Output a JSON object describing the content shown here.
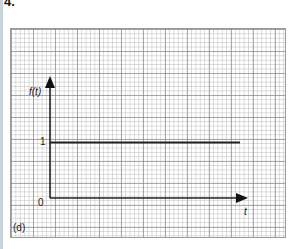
{
  "problem_number": "4.",
  "panel_label": "(d)",
  "axes": {
    "y_label": "f(t)",
    "x_label": "t",
    "origin_label": "0",
    "y_tick_label": "1"
  },
  "function": {
    "description": "constant function f(t) = 1 for t >= 0",
    "value": 1
  },
  "colors": {
    "grid_major": "#888888",
    "grid_minor": "#bbbbbb",
    "curve": "#222222"
  }
}
